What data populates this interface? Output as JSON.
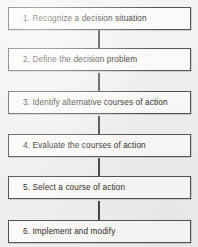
{
  "diagram": {
    "type": "flowchart",
    "orientation": "vertical",
    "background_color": "#f1f0ee",
    "box_fill_color": "#fbfaf8",
    "box_border_color": "#55534f",
    "connector_color": "#4a4845",
    "text_color": "#2e2c2a",
    "steps": [
      {
        "number": "1.",
        "text": "1. Recognize a decision situation"
      },
      {
        "number": "2.",
        "text": "2. Define the decision problem"
      },
      {
        "number": "3.",
        "text": "3.  Identify alternative courses of action"
      },
      {
        "number": "4.",
        "text": "4. Evaluate the courses of action"
      },
      {
        "number": "5.",
        "text": "5.  Select a course of action"
      },
      {
        "number": "6.",
        "text": "6. Implement and modify"
      }
    ],
    "connector_count": 5
  }
}
